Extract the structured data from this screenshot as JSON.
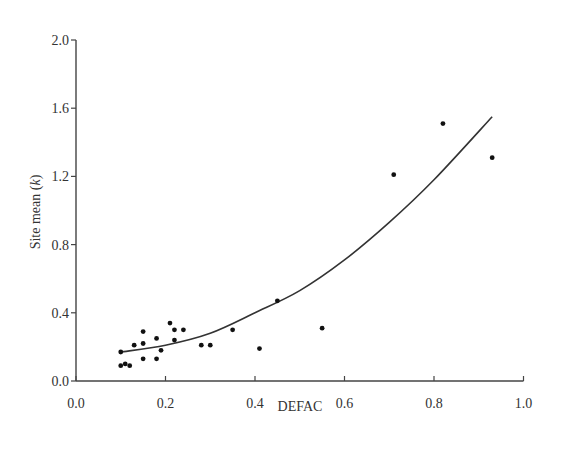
{
  "chart_data": {
    "type": "scatter",
    "title": "",
    "xlabel": "DEFAC",
    "ylabel": "Site mean (k)",
    "ylabel_parts": {
      "prefix": "Site mean (",
      "italic": "k",
      "suffix": ")"
    },
    "xlim": [
      0.0,
      1.0
    ],
    "ylim": [
      0.0,
      2.0
    ],
    "x_ticks": [
      "0.0",
      "0.2",
      "0.4",
      "0.6",
      "0.8",
      "1.0"
    ],
    "y_ticks": [
      "0.0",
      "0.4",
      "0.8",
      "1.2",
      "1.6",
      "2.0"
    ],
    "grid": false,
    "legend": null,
    "series": [
      {
        "name": "observed",
        "kind": "scatter",
        "x": [
          0.1,
          0.1,
          0.11,
          0.12,
          0.13,
          0.15,
          0.15,
          0.15,
          0.18,
          0.18,
          0.19,
          0.21,
          0.22,
          0.22,
          0.24,
          0.28,
          0.3,
          0.35,
          0.41,
          0.45,
          0.55,
          0.71,
          0.82,
          0.93
        ],
        "y": [
          0.17,
          0.09,
          0.1,
          0.09,
          0.21,
          0.29,
          0.22,
          0.13,
          0.25,
          0.13,
          0.18,
          0.34,
          0.3,
          0.24,
          0.3,
          0.21,
          0.21,
          0.3,
          0.19,
          0.47,
          0.31,
          1.21,
          1.51,
          1.31
        ]
      },
      {
        "name": "fitted curve",
        "kind": "line",
        "x": [
          0.1,
          0.2,
          0.3,
          0.4,
          0.5,
          0.6,
          0.7,
          0.8,
          0.93
        ],
        "y": [
          0.17,
          0.21,
          0.28,
          0.4,
          0.53,
          0.71,
          0.93,
          1.18,
          1.55
        ]
      }
    ]
  }
}
